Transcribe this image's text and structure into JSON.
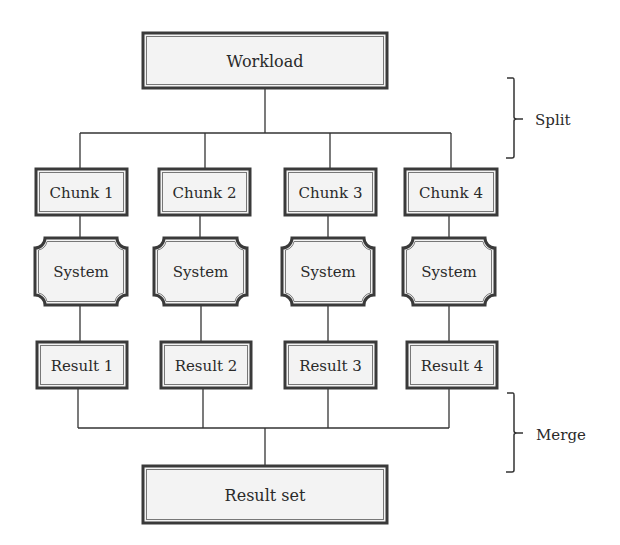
{
  "diagram": {
    "top": {
      "label": "Workload"
    },
    "bottom": {
      "label": "Result set"
    },
    "columns": [
      {
        "chunk": "Chunk 1",
        "system": "System",
        "result": "Result 1"
      },
      {
        "chunk": "Chunk 2",
        "system": "System",
        "result": "Result 2"
      },
      {
        "chunk": "Chunk 3",
        "system": "System",
        "result": "Result 3"
      },
      {
        "chunk": "Chunk 4",
        "system": "System",
        "result": "Result 4"
      }
    ],
    "braces": {
      "split": "Split",
      "merge": "Merge"
    }
  },
  "colors": {
    "box_fill": "#f3f3f3",
    "border": "#3a3a3a",
    "line": "#333333",
    "text": "#2a2a2a"
  }
}
